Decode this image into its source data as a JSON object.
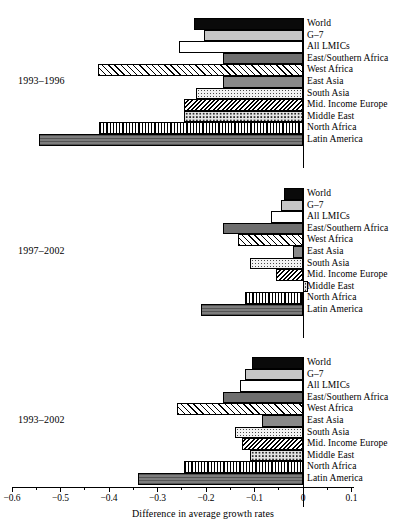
{
  "chart_data": {
    "type": "bar",
    "orientation": "horizontal",
    "title": "",
    "xlabel": "Difference in average growth rates",
    "ylabel": "",
    "xlim": [
      -0.6,
      0.1
    ],
    "xticks": [
      -0.6,
      -0.5,
      -0.4,
      -0.3,
      -0.2,
      -0.1,
      0,
      0.1
    ],
    "xticklabels": [
      "−0.6",
      "−0.5",
      "−0.4",
      "−0.3",
      "−0.2",
      "−0.1",
      "0",
      "0.1"
    ],
    "grid": false,
    "legend": "none",
    "categories": [
      "World",
      "G–7",
      "All LMICs",
      "East/Southern Africa",
      "West Africa",
      "East Asia",
      "South Asia",
      "Mid. Income Europe",
      "Middle East",
      "North Africa",
      "Latin America"
    ],
    "panels": [
      {
        "label": "1993–1996",
        "values": [
          -0.225,
          -0.205,
          -0.255,
          -0.165,
          -0.423,
          -0.165,
          -0.22,
          -0.245,
          -0.245,
          -0.42,
          -0.545
        ]
      },
      {
        "label": "1997–2002",
        "values": [
          -0.04,
          -0.045,
          -0.065,
          -0.165,
          -0.135,
          -0.02,
          -0.11,
          -0.055,
          0.01,
          -0.12,
          -0.21
        ]
      },
      {
        "label": "1993–2002",
        "values": [
          -0.105,
          -0.12,
          -0.13,
          -0.165,
          -0.26,
          -0.085,
          -0.14,
          -0.125,
          -0.11,
          -0.245,
          -0.34
        ]
      }
    ],
    "series_fills": [
      "f-black",
      "f-ltgray",
      "f-white",
      "f-dkgray",
      "f-diagL",
      "f-medgray",
      "f-dots",
      "f-diagR",
      "f-dotsB",
      "f-vert",
      "f-crossgray"
    ]
  },
  "colors": {
    "axis": "#000000",
    "background": "#ffffff"
  }
}
